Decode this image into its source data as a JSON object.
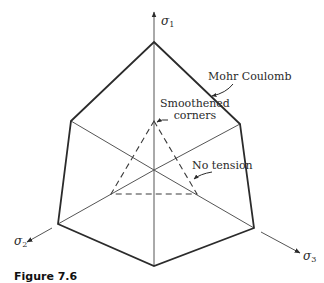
{
  "figure": {
    "caption": "Figure 7.6"
  },
  "axes": {
    "sigma1": {
      "symbol": "σ",
      "subscript": "1"
    },
    "sigma2": {
      "symbol": "σ",
      "subscript": "2"
    },
    "sigma3": {
      "symbol": "σ",
      "subscript": "3"
    }
  },
  "annotations": {
    "mohr_coulomb": "Mohr Coulomb",
    "smoothened_line1": "Smoothened",
    "smoothened_line2": "corners",
    "no_tension": "No tension"
  },
  "colors": {
    "outline": "#2b2b2b",
    "thin_line": "#555555",
    "dashed": "#3a3a3a",
    "background": "#ffffff"
  }
}
